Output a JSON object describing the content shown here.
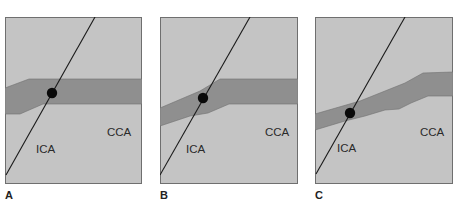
{
  "figure": {
    "colors": {
      "background": "#c4c4c4",
      "vessel_band": "#8f8f8f",
      "border": "#6f6f6f",
      "line": "#1a1a1a",
      "dot": "#0a0a0a"
    },
    "panels": [
      {
        "letter": "A",
        "label_ica": "ICA",
        "label_cca": "CCA",
        "description": "Scan line intersecting vessel at ICA/CCA junction, horizontal band"
      },
      {
        "letter": "B",
        "label_ica": "ICA",
        "label_cca": "CCA",
        "description": "Scan line intersecting vessel, band angled on left"
      },
      {
        "letter": "C",
        "label_ica": "ICA",
        "label_cca": "CCA",
        "description": "Scan line intersecting vessel, band sloped upward to right"
      }
    ]
  }
}
